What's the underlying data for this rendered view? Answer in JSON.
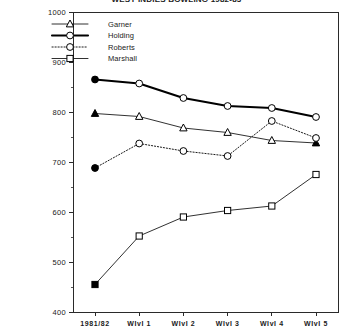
{
  "chart_data": {
    "type": "line",
    "title": "WEST INDIES BOWLING 1982-83",
    "xlabel": "",
    "ylabel": "",
    "categories": [
      "1981/82",
      "WIvI 1",
      "WIvI 2",
      "WIvI 3",
      "WIvI 4",
      "WIvI 5"
    ],
    "ylim": [
      400,
      1000
    ],
    "ytick_step": 100,
    "yminor_step": 50,
    "yticks": [
      400,
      500,
      600,
      700,
      800,
      900,
      1000
    ],
    "ytick_labels": [
      "400",
      "500",
      "600",
      "700",
      "800",
      "900",
      "1000"
    ],
    "grid": false,
    "legend_position": "upper-left-inside",
    "series": [
      {
        "name": "Garner",
        "marker": "triangle",
        "line_style": "solid-thin",
        "values": [
          797,
          791,
          768,
          759,
          743,
          738
        ],
        "filled_points": [
          0,
          5
        ]
      },
      {
        "name": "Holding",
        "marker": "circle",
        "line_style": "solid-thick",
        "values": [
          865,
          857,
          828,
          812,
          808,
          790
        ],
        "filled_points": [
          0
        ]
      },
      {
        "name": "Roberts",
        "marker": "circle",
        "line_style": "dotted",
        "values": [
          688,
          737,
          722,
          712,
          782,
          748
        ],
        "filled_points": [
          0
        ]
      },
      {
        "name": "Marshall",
        "marker": "square",
        "line_style": "solid-thin",
        "values": [
          455,
          552,
          590,
          603,
          612,
          675
        ],
        "filled_points": [
          0
        ]
      }
    ]
  }
}
